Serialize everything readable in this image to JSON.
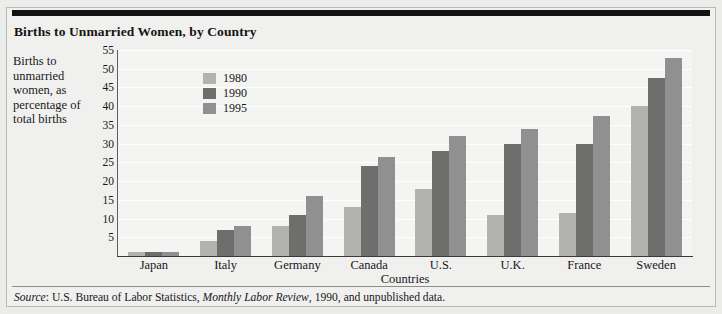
{
  "figure": {
    "title": "Births to Unmarried Women, by Country",
    "source_prefix": "Source",
    "source_sep": ": ",
    "source_part1": "U.S. Bureau of Labor Statistics, ",
    "source_italic": "Monthly Labor Review",
    "source_part2": ", 1990, and unpublished data."
  },
  "colors": {
    "series_1980": "#b2b2b0",
    "series_1990": "#6e6e6c",
    "series_1995": "#909090",
    "page_background": "#f0f0ef",
    "plot_background": "#f4f4f3",
    "gridline": "#ffffff",
    "axis": "#3a3a39",
    "top_rule": "#131313",
    "text": "#17171a"
  },
  "chart_data": {
    "type": "bar",
    "title": "Births to Unmarried Women, by Country",
    "xlabel": "Countries",
    "ylabel": "Births to unmarried women, as percentage of total births",
    "categories": [
      "Japan",
      "Italy",
      "Germany",
      "Canada",
      "U.S.",
      "U.K.",
      "France",
      "Sweden"
    ],
    "series": [
      {
        "name": "1980",
        "values": [
          1,
          4,
          8,
          13,
          18,
          11,
          11.5,
          40
        ]
      },
      {
        "name": "1990",
        "values": [
          1,
          7,
          11,
          24,
          28,
          30,
          30,
          47.5
        ]
      },
      {
        "name": "1995",
        "values": [
          1,
          8,
          16,
          26.5,
          32,
          34,
          37.5,
          53
        ]
      }
    ],
    "ylim": [
      0,
      55
    ],
    "yticks": [
      5,
      10,
      15,
      20,
      25,
      30,
      35,
      40,
      45,
      50,
      55
    ],
    "grid": true,
    "legend_position": "upper left inside",
    "legend_entries": [
      "1980",
      "1990",
      "1995"
    ]
  }
}
